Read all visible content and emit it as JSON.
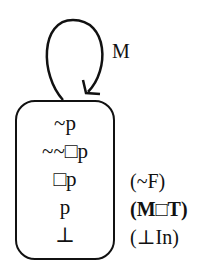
{
  "diagram": {
    "loop_label": "M",
    "world_lines": [
      "~p",
      "~~□p",
      "□p",
      "p",
      "⊥"
    ],
    "justifications": [
      {
        "line": 2,
        "text": "(~F)",
        "bold": false
      },
      {
        "line": 3,
        "text": "(M□T)",
        "bold": true
      },
      {
        "line": 4,
        "text": "(⊥In)",
        "bold": false
      }
    ]
  }
}
